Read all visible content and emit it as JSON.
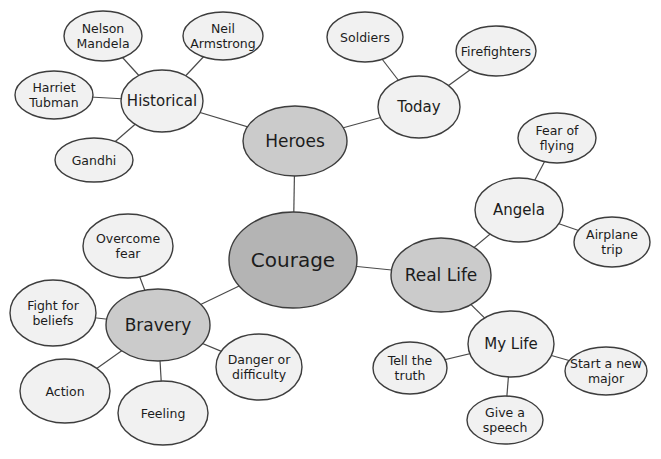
{
  "diagram": {
    "type": "mindmap",
    "background": "#ffffff",
    "edge_color": "#4a4a4a",
    "node_border_color": "#3d3d3d",
    "text_color": "#1c1c1c",
    "fills": {
      "root": "#b4b4b4",
      "branch": "#cbcbcb",
      "sub": "#f1f1f1",
      "leaf": "#f1f1f1"
    },
    "nodes": [
      {
        "id": "courage",
        "label": "Courage",
        "lines": [
          "Courage"
        ],
        "level": "root",
        "x": 293,
        "y": 260,
        "rx": 64,
        "ry": 48
      },
      {
        "id": "heroes",
        "label": "Heroes",
        "lines": [
          "Heroes"
        ],
        "level": "branch",
        "x": 295,
        "y": 141,
        "rx": 52,
        "ry": 35
      },
      {
        "id": "bravery",
        "label": "Bravery",
        "lines": [
          "Bravery"
        ],
        "level": "branch",
        "x": 158,
        "y": 325,
        "rx": 52,
        "ry": 36
      },
      {
        "id": "reallife",
        "label": "Real Life",
        "lines": [
          "Real Life"
        ],
        "level": "branch",
        "x": 441,
        "y": 275,
        "rx": 50,
        "ry": 37
      },
      {
        "id": "historical",
        "label": "Historical",
        "lines": [
          "Historical"
        ],
        "level": "sub",
        "x": 162,
        "y": 101,
        "rx": 41,
        "ry": 31
      },
      {
        "id": "today",
        "label": "Today",
        "lines": [
          "Today"
        ],
        "level": "sub",
        "x": 419,
        "y": 107,
        "rx": 41,
        "ry": 31
      },
      {
        "id": "nelson",
        "label": "Nelson Mandela",
        "lines": [
          "Nelson",
          "Mandela"
        ],
        "level": "leaf",
        "x": 103,
        "y": 36,
        "rx": 39,
        "ry": 25
      },
      {
        "id": "neil",
        "label": "Neil Armstrong",
        "lines": [
          "Neil",
          "Armstrong"
        ],
        "level": "leaf",
        "x": 223,
        "y": 36,
        "rx": 40,
        "ry": 24
      },
      {
        "id": "harriet",
        "label": "Harriet Tubman",
        "lines": [
          "Harriet",
          "Tubman"
        ],
        "level": "leaf",
        "x": 54,
        "y": 95,
        "rx": 39,
        "ry": 24
      },
      {
        "id": "gandhi",
        "label": "Gandhi",
        "lines": [
          "Gandhi"
        ],
        "level": "leaf",
        "x": 94,
        "y": 160,
        "rx": 39,
        "ry": 22
      },
      {
        "id": "soldiers",
        "label": "Soldiers",
        "lines": [
          "Soldiers"
        ],
        "level": "leaf",
        "x": 365,
        "y": 37,
        "rx": 38,
        "ry": 25
      },
      {
        "id": "firefighters",
        "label": "Firefighters",
        "lines": [
          "Firefighters"
        ],
        "level": "leaf",
        "x": 496,
        "y": 51,
        "rx": 40,
        "ry": 25
      },
      {
        "id": "fearflying",
        "label": "Fear of flying",
        "lines": [
          "Fear of",
          "flying"
        ],
        "level": "leaf",
        "x": 557,
        "y": 138,
        "rx": 39,
        "ry": 25
      },
      {
        "id": "angela",
        "label": "Angela",
        "lines": [
          "Angela"
        ],
        "level": "sub",
        "x": 519,
        "y": 210,
        "rx": 44,
        "ry": 32
      },
      {
        "id": "airplane",
        "label": "Airplane trip",
        "lines": [
          "Airplane",
          "trip"
        ],
        "level": "leaf",
        "x": 612,
        "y": 242,
        "rx": 38,
        "ry": 25
      },
      {
        "id": "mylife",
        "label": "My Life",
        "lines": [
          "My Life"
        ],
        "level": "sub",
        "x": 511,
        "y": 344,
        "rx": 43,
        "ry": 33
      },
      {
        "id": "tellthetruth",
        "label": "Tell the truth",
        "lines": [
          "Tell the",
          "truth"
        ],
        "level": "leaf",
        "x": 410,
        "y": 368,
        "rx": 37,
        "ry": 26
      },
      {
        "id": "startmajor",
        "label": "Start a new major",
        "lines": [
          "Start a new",
          "major"
        ],
        "level": "leaf",
        "x": 606,
        "y": 371,
        "rx": 41,
        "ry": 24
      },
      {
        "id": "givespeech",
        "label": "Give a speech",
        "lines": [
          "Give a",
          "speech"
        ],
        "level": "leaf",
        "x": 505,
        "y": 420,
        "rx": 38,
        "ry": 24
      },
      {
        "id": "overcome",
        "label": "Overcome fear",
        "lines": [
          "Overcome",
          "fear"
        ],
        "level": "leaf",
        "x": 128,
        "y": 246,
        "rx": 45,
        "ry": 32
      },
      {
        "id": "fightbeliefs",
        "label": "Fight for beliefs",
        "lines": [
          "Fight for",
          "beliefs"
        ],
        "level": "leaf",
        "x": 53,
        "y": 313,
        "rx": 43,
        "ry": 33
      },
      {
        "id": "action",
        "label": "Action",
        "lines": [
          "Action"
        ],
        "level": "leaf",
        "x": 65,
        "y": 391,
        "rx": 45,
        "ry": 32
      },
      {
        "id": "feeling",
        "label": "Feeling",
        "lines": [
          "Feeling"
        ],
        "level": "leaf",
        "x": 163,
        "y": 413,
        "rx": 45,
        "ry": 32
      },
      {
        "id": "danger",
        "label": "Danger or difficulty",
        "lines": [
          "Danger or",
          "difficulty"
        ],
        "level": "leaf",
        "x": 259,
        "y": 367,
        "rx": 43,
        "ry": 33
      }
    ],
    "edges": [
      [
        "courage",
        "heroes"
      ],
      [
        "courage",
        "bravery"
      ],
      [
        "courage",
        "reallife"
      ],
      [
        "heroes",
        "historical"
      ],
      [
        "heroes",
        "today"
      ],
      [
        "historical",
        "nelson"
      ],
      [
        "historical",
        "neil"
      ],
      [
        "historical",
        "harriet"
      ],
      [
        "historical",
        "gandhi"
      ],
      [
        "today",
        "soldiers"
      ],
      [
        "today",
        "firefighters"
      ],
      [
        "reallife",
        "angela"
      ],
      [
        "reallife",
        "mylife"
      ],
      [
        "angela",
        "fearflying"
      ],
      [
        "angela",
        "airplane"
      ],
      [
        "mylife",
        "tellthetruth"
      ],
      [
        "mylife",
        "startmajor"
      ],
      [
        "mylife",
        "givespeech"
      ],
      [
        "bravery",
        "overcome"
      ],
      [
        "bravery",
        "fightbeliefs"
      ],
      [
        "bravery",
        "action"
      ],
      [
        "bravery",
        "feeling"
      ],
      [
        "bravery",
        "danger"
      ]
    ]
  }
}
